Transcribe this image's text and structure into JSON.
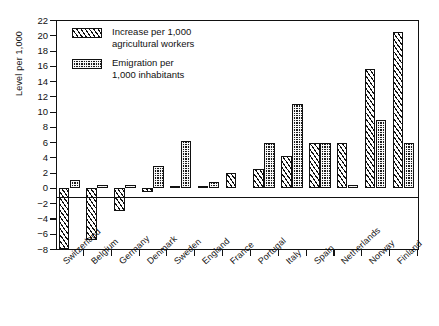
{
  "chart_data": {
    "type": "bar",
    "title": "",
    "xlabel": "",
    "ylabel": "Level per 1,000",
    "ylim": [
      -8,
      22
    ],
    "ytick_values": [
      22,
      20,
      18,
      16,
      14,
      12,
      10,
      8,
      6,
      4,
      2,
      0,
      -2,
      -4,
      -6,
      -8
    ],
    "ytick_labels": [
      "22",
      "20",
      "18",
      "16",
      "14",
      "12",
      "10",
      "8",
      "6",
      "4",
      "2",
      "0",
      "−2",
      "−4",
      "−6",
      "−8"
    ],
    "grid": false,
    "legend_position": "top-left",
    "categories": [
      "Switzerland",
      "Belgium",
      "Germany",
      "Denmark",
      "Sweden",
      "England",
      "France",
      "Portugal",
      "Italy",
      "Spain",
      "Netherlands",
      "Norway",
      "Finland"
    ],
    "series": [
      {
        "name": "Increase per 1,000 agricultural workers",
        "pattern": "diagonal-hatch",
        "values": [
          -8.0,
          -6.7,
          -3.0,
          -0.5,
          0.3,
          0.3,
          2.0,
          2.5,
          4.2,
          6.0,
          6.0,
          15.7,
          20.5
        ]
      },
      {
        "name": "Emigration per 1,000 inhabitants",
        "pattern": "dense-dots",
        "values": [
          1.1,
          0.5,
          0.5,
          3.0,
          6.2,
          0.8,
          null,
          6.0,
          11.0,
          6.0,
          0.5,
          9.0,
          6.0
        ]
      }
    ]
  },
  "legend": {
    "items": [
      {
        "pattern": "diagonal-hatch",
        "line1": "Increase per 1,000",
        "line2": "agricultural workers"
      },
      {
        "pattern": "dense-dots",
        "line1": "Emigration per",
        "line2": "1,000 inhabitants"
      }
    ]
  },
  "colors": {
    "axis": "#111111",
    "background": "#ffffff",
    "series_increase": "#ffffff",
    "series_emigration": "#1a1a1a"
  }
}
